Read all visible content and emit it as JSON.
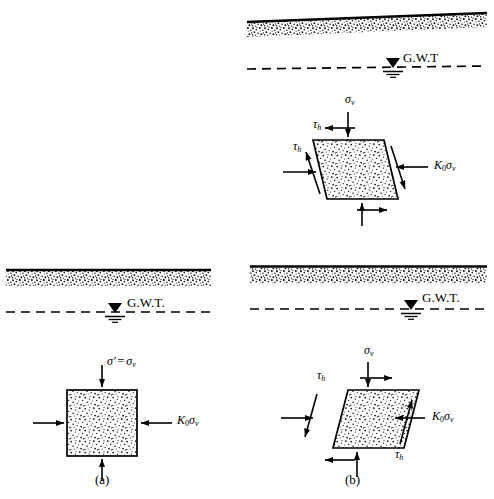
{
  "figure": {
    "background_color": "#ffffff",
    "line_color": "#000000",
    "stipple_color": "#1a1a1a",
    "width": 494,
    "height": 499
  },
  "panels": [
    {
      "id": "panel-a",
      "caption": "(a)",
      "ground": {
        "type": "level",
        "label": "ground-surface"
      },
      "water_table": {
        "label": "G.W.T.",
        "symbol": "water-table-triangle"
      },
      "element": {
        "shape": "square",
        "shear": false,
        "loads": [
          {
            "name": "vertical-stress",
            "label_html": "σ′ = σv",
            "sigma": "σ",
            "prime": "′",
            "equals": "=",
            "sigma2": "σ",
            "subscript": "v",
            "direction": "down"
          },
          {
            "name": "horizontal-stress",
            "label_html": "K0σv",
            "K": "K",
            "K_sub": "0",
            "sigma": "σ",
            "sigma_sub": "v",
            "direction": "inward"
          },
          {
            "name": "bottom-reaction",
            "direction": "up"
          },
          {
            "name": "left-reaction",
            "direction": "right"
          }
        ]
      }
    },
    {
      "id": "panel-b-top",
      "caption": "",
      "ground": {
        "type": "sloping",
        "label": "sloping-ground-surface"
      },
      "water_table": {
        "label": "G.W.T",
        "symbol": "water-table-triangle"
      },
      "element": {
        "shape": "parallelogram",
        "lean": "left",
        "shear": true,
        "loads": [
          {
            "name": "vertical-stress",
            "label_html": "σv",
            "sigma": "σ",
            "sigma_sub": "v",
            "direction": "down"
          },
          {
            "name": "horizontal-stress",
            "label_html": "K0σv",
            "K": "K",
            "K_sub": "0",
            "sigma": "σ",
            "sigma_sub": "v",
            "direction": "inward"
          },
          {
            "name": "shear-stress-top",
            "label_html": "τh",
            "tau": "τ",
            "tau_sub": "h",
            "direction": "left"
          },
          {
            "name": "shear-stress-side",
            "label_html": "τh",
            "tau": "τ",
            "tau_sub": "h",
            "direction": "up"
          }
        ]
      }
    },
    {
      "id": "panel-b-bottom",
      "caption": "(b)",
      "ground": {
        "type": "level",
        "label": "ground-surface"
      },
      "water_table": {
        "label": "G.W.T.",
        "symbol": "water-table-triangle"
      },
      "element": {
        "shape": "parallelogram",
        "lean": "right",
        "shear": true,
        "loads": [
          {
            "name": "vertical-stress",
            "label_html": "σv",
            "sigma": "σ",
            "sigma_sub": "v",
            "direction": "down"
          },
          {
            "name": "horizontal-stress",
            "label_html": "K0σv",
            "K": "K",
            "K_sub": "0",
            "sigma": "σ",
            "sigma_sub": "v",
            "direction": "inward"
          },
          {
            "name": "shear-stress-top",
            "label_html": "τh",
            "tau": "τ",
            "tau_sub": "h",
            "direction": "right"
          },
          {
            "name": "shear-stress-side",
            "label_html": "τh",
            "tau": "τ",
            "tau_sub": "h",
            "direction": "down"
          }
        ]
      }
    }
  ],
  "labels": {
    "gwt_a": "G.W.T.",
    "gwt_b_top": "G.W.T",
    "gwt_b_bottom": "G.W.T.",
    "caption_a": "(a)",
    "caption_b": "(b)",
    "sigma": "σ",
    "sigma_prime": "′",
    "equals": "=",
    "sub_v": "v",
    "sub_h": "h",
    "sub_0": "0",
    "K": "K",
    "tau": "τ"
  }
}
